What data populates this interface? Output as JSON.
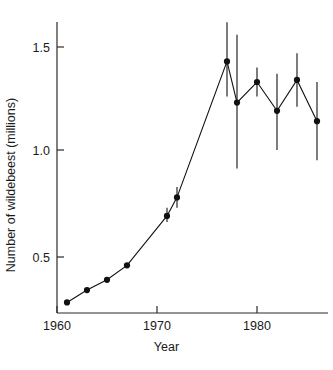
{
  "figure": {
    "background": "#ffffff",
    "ink_color": "#111111"
  },
  "chart_data": {
    "type": "line",
    "title": "",
    "subtitle": "",
    "xlabel": "Year",
    "ylabel": "Number of wildebeest (millions)",
    "xlim": [
      1959.5,
      1987.0
    ],
    "ylim": [
      0.21,
      1.64
    ],
    "grid": false,
    "legend": null,
    "legend_position": "none",
    "marker": "filled-circle",
    "errorbars": "vertical-line-no-caps",
    "x_ticks": [
      1960,
      1970,
      1980
    ],
    "x_tick_labels": [
      "1960",
      "1970",
      "1980"
    ],
    "y_ticks": [
      0.5,
      1.0,
      1.5
    ],
    "y_tick_labels": [
      "0.5",
      "1.0",
      "1.5"
    ],
    "x": [
      1961,
      1963,
      1965,
      1967,
      1971,
      1972,
      1977,
      1978,
      1980,
      1982,
      1984,
      1986
    ],
    "values": [
      0.26,
      0.32,
      0.37,
      0.44,
      0.68,
      0.77,
      1.43,
      1.23,
      1.33,
      1.19,
      1.34,
      1.14
    ],
    "error_low": [
      null,
      null,
      null,
      null,
      0.65,
      0.72,
      1.26,
      0.91,
      1.26,
      1.0,
      1.21,
      0.95
    ],
    "error_high": [
      null,
      null,
      null,
      null,
      0.72,
      0.82,
      1.62,
      1.56,
      1.4,
      1.37,
      1.47,
      1.33
    ],
    "series": [
      {
        "name": "Serengeti wildebeest population",
        "x": [
          1961,
          1963,
          1965,
          1967,
          1971,
          1972,
          1977,
          1978,
          1980,
          1982,
          1984,
          1986
        ],
        "values": [
          0.26,
          0.32,
          0.37,
          0.44,
          0.68,
          0.77,
          1.43,
          1.23,
          1.33,
          1.19,
          1.34,
          1.14
        ]
      }
    ],
    "annotations": []
  }
}
